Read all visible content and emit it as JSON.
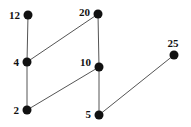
{
  "diagram": {
    "type": "hasse",
    "node_color": "#111111",
    "edge_color": "#555555",
    "nodes": [
      {
        "id": "12",
        "label": "12",
        "x": 28,
        "y": 15,
        "lx": 20,
        "ly": 19,
        "anchor": "end"
      },
      {
        "id": "20",
        "label": "20",
        "x": 98,
        "y": 14,
        "lx": 90,
        "ly": 16,
        "anchor": "end"
      },
      {
        "id": "4",
        "label": "4",
        "x": 27,
        "y": 62,
        "lx": 19,
        "ly": 66,
        "anchor": "end"
      },
      {
        "id": "10",
        "label": "10",
        "x": 99,
        "y": 67,
        "lx": 91,
        "ly": 66,
        "anchor": "end"
      },
      {
        "id": "25",
        "label": "25",
        "x": 174,
        "y": 55,
        "lx": 173,
        "ly": 47,
        "anchor": "middle"
      },
      {
        "id": "2",
        "label": "2",
        "x": 27,
        "y": 110,
        "lx": 19,
        "ly": 114,
        "anchor": "end"
      },
      {
        "id": "5",
        "label": "5",
        "x": 99,
        "y": 115,
        "lx": 91,
        "ly": 118,
        "anchor": "end"
      }
    ],
    "edges": [
      [
        "12",
        "4"
      ],
      [
        "4",
        "2"
      ],
      [
        "20",
        "4"
      ],
      [
        "20",
        "10"
      ],
      [
        "10",
        "2"
      ],
      [
        "10",
        "5"
      ],
      [
        "25",
        "5"
      ]
    ]
  }
}
